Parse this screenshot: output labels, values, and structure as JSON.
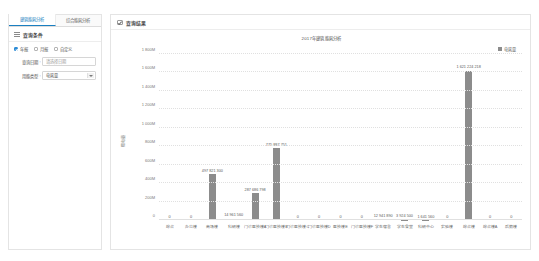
{
  "left_panel": {
    "tabs": [
      {
        "label": "建筑能耗分析",
        "active": true
      },
      {
        "label": "综合能耗分析",
        "active": false
      }
    ],
    "section_title": "查询条件",
    "list_icon": "list-icon",
    "radios": [
      {
        "label": "年报",
        "checked": true
      },
      {
        "label": "月报",
        "checked": false
      },
      {
        "label": "自定义",
        "checked": false
      }
    ],
    "fields": [
      {
        "label": "查询日期",
        "colon": ":",
        "value": "",
        "placeholder": "请选择日期"
      },
      {
        "label": "用能类型",
        "colon": ":",
        "value": "电耗量",
        "type": "select"
      }
    ]
  },
  "right_panel": {
    "header_title": "查询结果",
    "header_icon": "checkbox-icon"
  },
  "chart_data": {
    "type": "bar",
    "title": "2017年建筑能耗分析",
    "xlabel": "",
    "ylabel": "用电量",
    "ylim": [
      0,
      1800000000
    ],
    "grid": true,
    "legend_position": "top-right",
    "legend": [
      "电耗量"
    ],
    "accent_color": "#8c8c8c",
    "ytick_labels": [
      "1 800M",
      "1 600M",
      "1 400M",
      "1 200M",
      "1 000M",
      "800M",
      "600M",
      "400M",
      "200M",
      "0"
    ],
    "ytick_values": [
      1800000000,
      1600000000,
      1400000000,
      1200000000,
      1000000000,
      800000000,
      600000000,
      400000000,
      200000000,
      0
    ],
    "categories": [
      "综合",
      "办公楼",
      "商场楼",
      "科研楼",
      "门诊医技楼A",
      "门诊医技楼B",
      "门诊医技楼C",
      "门诊医技楼D",
      "医技楼E",
      "门诊医技楼F",
      "学生宿舍",
      "学生食堂",
      "科研中心",
      "实验楼",
      "综合楼",
      "综合楼A",
      "后勤楼"
    ],
    "values": [
      0,
      0,
      497821300,
      14961560,
      287686798,
      775887751,
      0,
      0,
      0,
      0,
      12941890,
      3924500,
      1641560,
      0,
      1621224218,
      0,
      0
    ],
    "value_labels": [
      "0",
      "0",
      "497 821 300",
      "14 961 560",
      "287 686 798",
      "775 887 751",
      "0",
      "0",
      "0",
      "0",
      "12 941 890",
      "3 924 500",
      "1 641 560",
      "0",
      "1 621 224 218",
      "0",
      "0"
    ]
  }
}
